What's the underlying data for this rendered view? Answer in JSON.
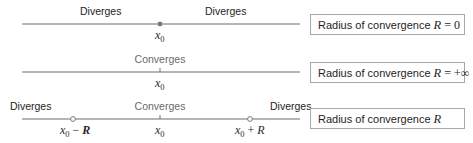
{
  "rows": [
    {
      "id": "zero-radius",
      "labels": {
        "left": "Diverges",
        "right": "Diverges"
      },
      "point_label": "x",
      "point_sub": "0",
      "box": {
        "text": "Radius of convergence ",
        "var": "R",
        "rel": " = ",
        "value": "0"
      }
    },
    {
      "id": "infinite-radius",
      "labels": {
        "center": "Converges"
      },
      "point_label": "x",
      "point_sub": "0",
      "box": {
        "text": "Radius of convergence ",
        "var": "R",
        "rel": " = ",
        "value": "+∞"
      }
    },
    {
      "id": "finite-radius",
      "labels": {
        "left": "Diverges",
        "center": "Converges",
        "right": "Diverges"
      },
      "point_label": "x",
      "point_sub": "0",
      "left_end": {
        "x": "x",
        "sub": "0",
        "op": " − ",
        "r": "R"
      },
      "right_end": {
        "x": "x",
        "sub": "0",
        "op": " + ",
        "r": "R"
      },
      "box": {
        "text": "Radius of convergence ",
        "var": "R"
      }
    }
  ],
  "colors": {
    "line": "#6e6e6e",
    "diverges_text": "#1e1e1e",
    "converges_text": "#6a6a6a",
    "box_border": "#a8a8a8"
  }
}
